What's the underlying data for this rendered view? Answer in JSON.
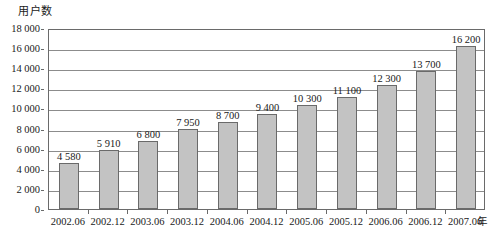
{
  "chart_data": {
    "type": "bar",
    "title": "",
    "ylabel": "用户数",
    "xlabel": "年",
    "categories": [
      "2002.06",
      "2002.12",
      "2003.06",
      "2003.12",
      "2004.06",
      "2004.12",
      "2005.06",
      "2005.12",
      "2006.06",
      "2006.12",
      "2007.06"
    ],
    "values": [
      4580,
      5910,
      6800,
      7950,
      8700,
      9400,
      10300,
      11100,
      12300,
      13700,
      16200
    ],
    "value_labels": [
      "4 580",
      "5 910",
      "6 800",
      "7 950",
      "8 700",
      "9 400",
      "10 300",
      "11 100",
      "12 300",
      "13 700",
      "16 200"
    ],
    "ylim": [
      0,
      18000
    ],
    "ytick_values": [
      0,
      2000,
      4000,
      6000,
      8000,
      10000,
      12000,
      14000,
      16000,
      18000
    ],
    "ytick_labels": [
      "0",
      "2 000",
      "4 000",
      "6 000",
      "8 000",
      "10 000",
      "12 000",
      "14 000",
      "16 000",
      "18 000"
    ],
    "grid": true,
    "legend": false,
    "bar_color": "#c3c3c3",
    "bar_border_color": "#6a6a6a",
    "axis_color": "#6a6a6a",
    "gridline_color": "#8c8c8c"
  }
}
